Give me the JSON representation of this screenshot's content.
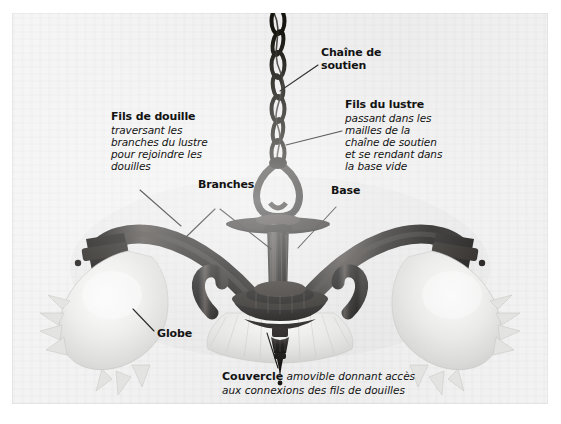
{
  "figure": {
    "language": "fr",
    "background_color": "#f1f1f1",
    "text_color": "#131313",
    "leader_line_color": "#111111"
  },
  "annotations": {
    "chaine": {
      "name": "chaine-de-soutien",
      "heading_lines": [
        "Chaîne de",
        "soutien"
      ],
      "body_lines": []
    },
    "fils_lustre": {
      "name": "fils-du-lustre",
      "heading": "Fils du lustre",
      "body_lines": [
        "passant dans les",
        "mailles de la",
        "chaîne de soutien",
        "et se rendant dans",
        "la base vide"
      ]
    },
    "fils_douille": {
      "name": "fils-de-douille",
      "heading": "Fils de douille",
      "body_lines": [
        "traversant les",
        "branches du lustre",
        "pour rejoindre les",
        "douilles"
      ]
    },
    "branches": {
      "name": "branches",
      "heading": "Branches"
    },
    "base": {
      "name": "base",
      "heading": "Base"
    },
    "globe": {
      "name": "globe",
      "heading": "Globe"
    },
    "couvercle": {
      "name": "couvercle",
      "heading": "Couvercle",
      "line1_rest": " amovible donnant accès",
      "line2": "aux connexions des fils de douilles"
    }
  }
}
